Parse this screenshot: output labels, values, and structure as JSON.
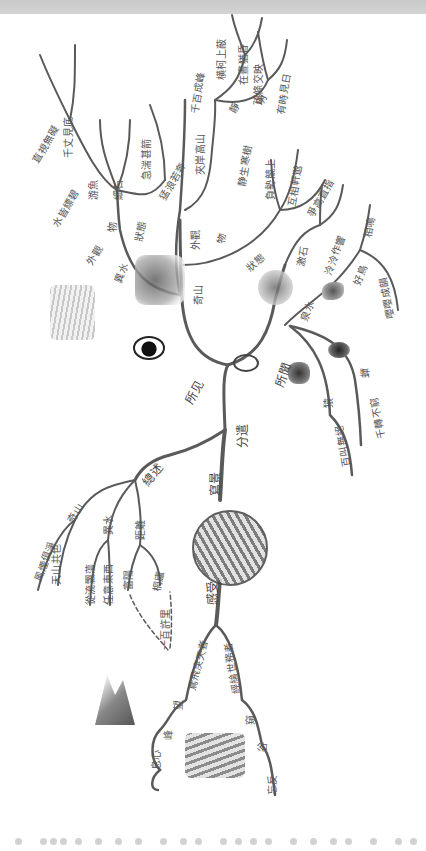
{
  "header": {
    "bar_color": "#cccccc"
  },
  "diagram": {
    "root_branches": [
      {
        "id": "fenglian",
        "label": "分遣"
      },
      {
        "id": "suojian",
        "label": "所见"
      },
      {
        "id": "suowen",
        "label": "所聞"
      },
      {
        "id": "jingzhi",
        "label": "總述"
      },
      {
        "id": "xiejing",
        "label": "寫景"
      },
      {
        "id": "ganwu",
        "label": "感受"
      }
    ],
    "suojian": {
      "yishui": {
        "label": "異水",
        "children": [
          {
            "label": "外觀",
            "children": [
              "水皆縹碧",
              "千丈見底",
              "直視無礙"
            ]
          },
          {
            "label": "物",
            "children": [
              "游魚",
              "細石"
            ]
          },
          {
            "label": "狀態",
            "children": [
              "急湍甚箭",
              "猛浪若奔"
            ]
          }
        ]
      },
      "qishan": {
        "label": "奇山",
        "children": [
          {
            "label": "外觀",
            "children": [
              "夾岸高山",
              "千百成峰"
            ]
          },
          {
            "label": "物",
            "children": [
              "寒樹",
              "負勢競上"
            ]
          },
          {
            "label": "靜",
            "children": [
              "横柯上蔽",
              "在晝猶昏"
            ]
          },
          {
            "label": "明",
            "children": [
              "疏條交映",
              "有時見日"
            ]
          },
          {
            "label": "狀態",
            "children": [
              "負勢競上",
              "互相軒邈",
              "爭高直指"
            ]
          }
        ]
      },
      "extra": [
        "千百成峰",
        "静生寒樹",
        "夾岸高山"
      ]
    },
    "suowen": {
      "items": [
        {
          "label": "泉水",
          "children": [
            "激石",
            "泠泠作響"
          ]
        },
        {
          "label": "好鳥",
          "children": [
            "相鳴",
            "嚶嚶成韻"
          ]
        },
        {
          "label": "蟬",
          "children": [
            "千轉不窮"
          ]
        },
        {
          "label": "猿",
          "children": [
            "百叫無絕"
          ]
        }
      ]
    },
    "zongshu": {
      "label": "總述",
      "children": [
        {
          "label": "奇山",
          "children": [
            "風煙俱淨",
            "天山共色"
          ]
        },
        {
          "label": "異水",
          "children": [
            "從流飄蕩",
            "任意東西"
          ]
        },
        {
          "label": "距離",
          "children": [
            "富陽",
            "桐廬"
          ]
        }
      ],
      "distance_note": "一百許里"
    },
    "ganshou": {
      "label": "感受",
      "left": {
        "label": "鳶飛戾天者",
        "children": [
          "望",
          "峰",
          "息心"
        ]
      },
      "right": {
        "label": "經綸世務者",
        "children": [
          "窺",
          "谷",
          "忘反"
        ]
      }
    },
    "icons": [
      "eye-icon",
      "ear-icon",
      "mountain-stream-illustration",
      "cliff-illustration",
      "waterfall-illustration",
      "globe-illustration",
      "rock-illustration",
      "bird-illustration",
      "monkey-illustration",
      "cicada-illustration",
      "mountain-peaks-illustration",
      "valley-illustration"
    ],
    "colors": {
      "line": "#5a5a5a",
      "text": "#555555",
      "background": "#ffffff",
      "footer_dots": "#d2d2d2"
    }
  }
}
